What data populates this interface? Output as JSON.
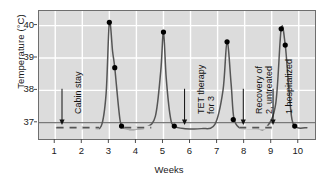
{
  "chart_data": {
    "type": "line",
    "title": "",
    "xlabel": "Weeks",
    "ylabel": "Temperature (°C)",
    "xlim": [
      0.4,
      10.6
    ],
    "ylim": [
      36.5,
      40.45
    ],
    "xticks": [
      1,
      2,
      3,
      4,
      5,
      6,
      7,
      8,
      9,
      10
    ],
    "xtick_labels": [
      "1",
      "2",
      "3",
      "4",
      "5",
      "6",
      "7",
      "8",
      "9",
      "10"
    ],
    "yticks": [
      37,
      38,
      39,
      40
    ],
    "ytick_labels": [
      "37",
      "38",
      "39",
      "40"
    ],
    "grid": true,
    "grid_color": "#ffffff",
    "plot_background": "#dcdcdc",
    "line_color": "#555555",
    "marker_color": "#000000",
    "series": [
      {
        "name": "Body temperature",
        "points": [
          {
            "x": 1.05,
            "y": 36.85
          },
          {
            "x": 1.45,
            "y": 36.85
          },
          {
            "x": 1.75,
            "y": 36.85
          },
          {
            "x": 2.05,
            "y": 36.85
          },
          {
            "x": 2.35,
            "y": 36.85
          },
          {
            "x": 2.7,
            "y": 36.9
          },
          {
            "x": 2.88,
            "y": 37.9
          },
          {
            "x": 3.0,
            "y": 40.1
          },
          {
            "x": 3.12,
            "y": 39.2
          },
          {
            "x": 3.2,
            "y": 38.7
          },
          {
            "x": 3.35,
            "y": 37.4
          },
          {
            "x": 3.45,
            "y": 36.9
          },
          {
            "x": 3.7,
            "y": 36.8
          },
          {
            "x": 4.0,
            "y": 36.8
          },
          {
            "x": 4.35,
            "y": 36.85
          },
          {
            "x": 4.7,
            "y": 37.2
          },
          {
            "x": 4.9,
            "y": 38.6
          },
          {
            "x": 5.0,
            "y": 39.8
          },
          {
            "x": 5.1,
            "y": 38.4
          },
          {
            "x": 5.25,
            "y": 37.2
          },
          {
            "x": 5.4,
            "y": 36.9
          },
          {
            "x": 5.8,
            "y": 36.82
          },
          {
            "x": 6.4,
            "y": 36.82
          },
          {
            "x": 6.9,
            "y": 36.95
          },
          {
            "x": 7.2,
            "y": 38.0
          },
          {
            "x": 7.35,
            "y": 39.5
          },
          {
            "x": 7.5,
            "y": 38.2
          },
          {
            "x": 7.6,
            "y": 37.15
          },
          {
            "x": 7.8,
            "y": 36.85
          },
          {
            "x": 8.1,
            "y": 36.82
          },
          {
            "x": 8.45,
            "y": 36.82
          },
          {
            "x": 8.8,
            "y": 36.85
          },
          {
            "x": 9.15,
            "y": 37.6
          },
          {
            "x": 9.35,
            "y": 39.9
          },
          {
            "x": 9.5,
            "y": 39.4
          },
          {
            "x": 9.62,
            "y": 38.2
          },
          {
            "x": 9.75,
            "y": 37.1
          },
          {
            "x": 9.95,
            "y": 36.85
          },
          {
            "x": 10.3,
            "y": 36.85
          }
        ],
        "markers": [
          {
            "x": 3.0,
            "y": 40.1
          },
          {
            "x": 3.2,
            "y": 38.7
          },
          {
            "x": 3.45,
            "y": 36.9
          },
          {
            "x": 5.0,
            "y": 39.8
          },
          {
            "x": 5.4,
            "y": 36.9
          },
          {
            "x": 7.35,
            "y": 39.5
          },
          {
            "x": 7.58,
            "y": 37.1
          },
          {
            "x": 9.35,
            "y": 39.9
          },
          {
            "x": 9.5,
            "y": 39.4
          },
          {
            "x": 9.85,
            "y": 36.9
          }
        ],
        "dashed_segments": [
          {
            "x_start": 1.05,
            "x_end": 2.62
          },
          {
            "x_start": 3.55,
            "x_end": 4.55
          },
          {
            "x_start": 7.8,
            "x_end": 9.0
          }
        ]
      }
    ],
    "reference_line": {
      "y": 37.0,
      "color": "#4d4d4d"
    },
    "annotations": [
      {
        "id": "cabin-stay",
        "text": "Cabin stay",
        "lines": [
          "Cabin stay"
        ],
        "x": 1.25,
        "arrow_to_y": 36.95
      },
      {
        "id": "tet-therapy",
        "text": "TET therapy for 3",
        "lines": [
          "TET therapy",
          "for 3"
        ],
        "x": 5.78,
        "arrow_to_y": 36.95
      },
      {
        "id": "recovery",
        "text": "Recovery of 2, untreated",
        "lines": [
          "Recovery of",
          "2, untreated"
        ],
        "x": 7.95,
        "arrow_to_y": 36.95
      },
      {
        "id": "hospitalized",
        "text": "1 hospitalized",
        "lines": [
          "1 hospitalized"
        ],
        "x": 9.05,
        "arrow_to_y": 36.95
      }
    ]
  }
}
